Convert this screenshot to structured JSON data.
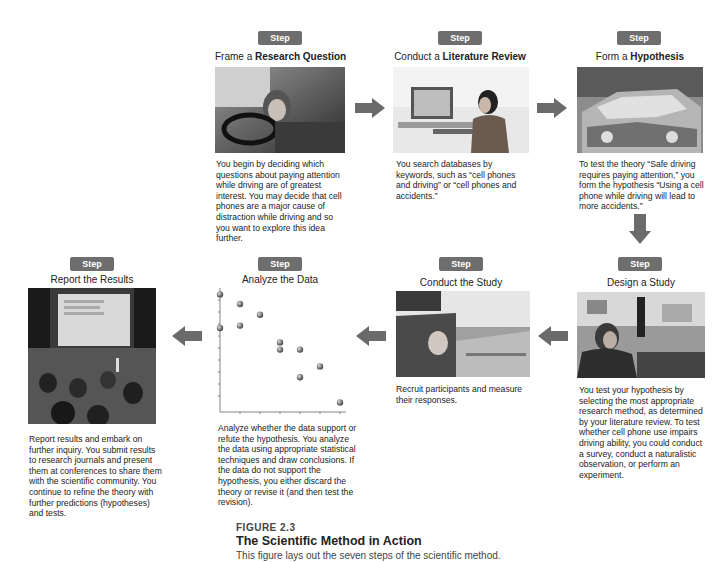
{
  "figure": {
    "label": "FIGURE 2.3",
    "title": "The Scientific Method in Action",
    "subtitle": "This figure lays out the seven steps of the scientific method."
  },
  "colors": {
    "badge": "#6e6e6e",
    "arrow": "#6b6b6b",
    "text": "#222222"
  },
  "steps": [
    {
      "badge": "Step 1",
      "title_pre": "Frame a ",
      "title_bold": "Research Question",
      "title_post": "",
      "image": "photo-woman-driving",
      "description": "You begin by deciding which questions about paying attention while driving are of greatest interest. You may decide that cell phones are a major cause of distraction while driving and so you want to explore this idea further."
    },
    {
      "badge": "Step 2",
      "title_pre": "Conduct a ",
      "title_bold": "Literature Review",
      "title_post": "",
      "image": "photo-woman-at-computer",
      "description": "You search databases by keywords, such as “cell phones and driving” or “cell phones and accidents.”"
    },
    {
      "badge": "Step 3",
      "title_pre": "Form a ",
      "title_bold": "Hypothesis",
      "title_post": "",
      "image": "photo-crashed-car",
      "description": "To test the theory “Safe driving requires paying attention,” you form the hypothesis “Using a cell phone while driving will lead to more accidents.”"
    },
    {
      "badge": "Step 4",
      "title_pre": "Design a Study",
      "title_bold": "",
      "title_post": "",
      "image": "photo-driving-simulator",
      "description": "You test your hypothesis by selecting the most appropriate research method, as determined by your literature review. To test whether cell phone use impairs driving ability, you could conduct a survey, conduct a naturalistic observation, or perform an experiment."
    },
    {
      "badge": "Step 5",
      "title_pre": "Conduct the Study",
      "title_bold": "",
      "title_post": "",
      "image": "photo-participant-in-car",
      "description": "Recruit participants and measure their responses."
    },
    {
      "badge": "Step 6",
      "title_pre": "Analyze the Data",
      "title_bold": "",
      "title_post": "",
      "image": "scatterplot",
      "description": "Analyze whether the data support or refute the hypothesis. You analyze the data using appropriate statistical techniques and draw conclusions. If the data do not support the hypothesis, you either discard the theory or revise it (and then test the revision)."
    },
    {
      "badge": "Step 7",
      "title_pre": "Report the Results",
      "title_bold": "",
      "title_post": "",
      "image": "photo-conference-audience",
      "description": "Report results and embark on further inquiry. You submit results to research journals and present them at conferences to share them with the scientific community. You continue to refine the theory with further predictions (hypotheses) and tests."
    }
  ],
  "chart_data": {
    "type": "scatter",
    "title": "Analyze the Data",
    "xlabel": "",
    "ylabel": "",
    "grid": false,
    "xlim": [
      0,
      6
    ],
    "ylim": [
      0,
      10
    ],
    "points": [
      {
        "x": 0,
        "y": 9.8
      },
      {
        "x": 0,
        "y": 7.0
      },
      {
        "x": 1,
        "y": 9.0
      },
      {
        "x": 1,
        "y": 7.2
      },
      {
        "x": 2,
        "y": 8.1
      },
      {
        "x": 3,
        "y": 5.8
      },
      {
        "x": 3,
        "y": 5.2
      },
      {
        "x": 4,
        "y": 5.2
      },
      {
        "x": 4,
        "y": 2.9
      },
      {
        "x": 5,
        "y": 3.8
      },
      {
        "x": 6,
        "y": 0.8
      }
    ]
  }
}
